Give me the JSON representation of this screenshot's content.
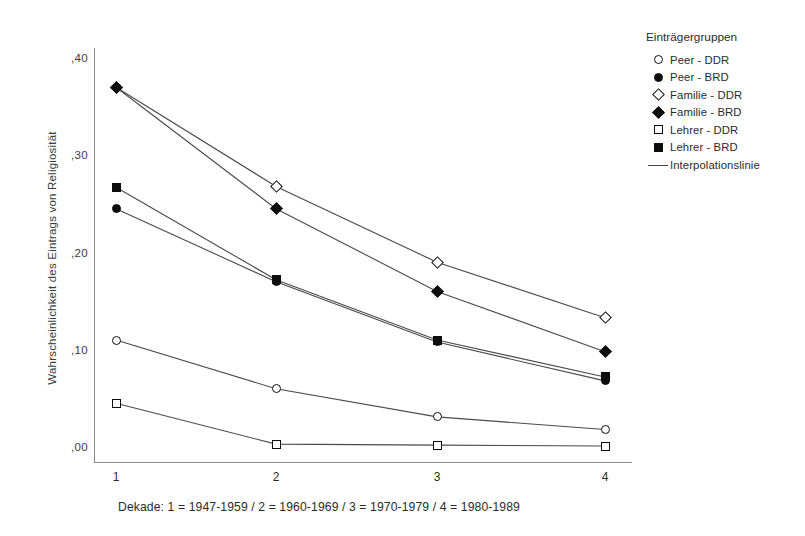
{
  "chart_data": {
    "type": "line",
    "title": "",
    "xlabel": "Dekade: 1 = 1947-1959 / 2 = 1960-1969 / 3 = 1970-1979 / 4 = 1980-1989",
    "ylabel": "Wahrscheinlichkeit des Eintrags von Religiosität",
    "categories": [
      "1",
      "2",
      "3",
      "4"
    ],
    "x_tick_labels": [
      "1",
      "2",
      "3",
      "4"
    ],
    "y_tick_labels": [
      ",40",
      ",30",
      ",20",
      ",10",
      ",00"
    ],
    "y_tick_values": [
      0.4,
      0.3,
      0.2,
      0.1,
      0.0
    ],
    "ylim": [
      0.0,
      0.42
    ],
    "grid": false,
    "legend_position": "right",
    "legend_title": "Einträgergruppen",
    "series": [
      {
        "name": "Peer - DDR",
        "marker": "circle-open",
        "values": [
          0.11,
          0.06,
          0.031,
          0.018
        ]
      },
      {
        "name": "Peer - BRD",
        "marker": "circle-filled",
        "values": [
          0.245,
          0.17,
          0.108,
          0.068
        ]
      },
      {
        "name": "Familie - DDR",
        "marker": "diamond-open",
        "values": [
          0.37,
          0.268,
          0.19,
          0.133
        ]
      },
      {
        "name": "Familie - BRD",
        "marker": "diamond-filled",
        "values": [
          0.37,
          0.245,
          0.16,
          0.098
        ]
      },
      {
        "name": "Lehrer - DDR",
        "marker": "square-open",
        "values": [
          0.045,
          0.003,
          0.002,
          0.001
        ]
      },
      {
        "name": "Lehrer - BRD",
        "marker": "square-filled",
        "values": [
          0.267,
          0.172,
          0.11,
          0.072
        ]
      }
    ],
    "interpolation_line_label": "Interpolationslinie",
    "colors": {
      "marker": "#0d0d0d",
      "line": "#4a4a4a",
      "axis": "#8b8b8b",
      "text": "#2b2b2b",
      "background": "#ffffff"
    }
  },
  "legend": {
    "title": "Einträgergruppen",
    "entries": [
      {
        "label": "Peer - DDR",
        "key": "circle-open"
      },
      {
        "label": "Peer - BRD",
        "key": "circle-filled"
      },
      {
        "label": "Familie - DDR",
        "key": "diamond-open"
      },
      {
        "label": "Familie - BRD",
        "key": "diamond-filled"
      },
      {
        "label": "Lehrer - DDR",
        "key": "square-open"
      },
      {
        "label": "Lehrer - BRD",
        "key": "square-filled"
      },
      {
        "label": "Interpolationslinie",
        "key": "line"
      }
    ]
  }
}
